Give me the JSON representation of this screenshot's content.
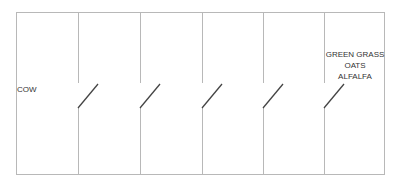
{
  "diagram": {
    "title": "",
    "left_label": "COW",
    "right_labels": [
      "GREEN GRASS",
      "OATS",
      "ALFALFA"
    ],
    "switch_count": 5,
    "switches": [
      {
        "index": 1,
        "state": "open"
      },
      {
        "index": 2,
        "state": "open"
      },
      {
        "index": 3,
        "state": "open"
      },
      {
        "index": 4,
        "state": "open"
      },
      {
        "index": 5,
        "state": "open"
      }
    ],
    "colors": {
      "frame_line": "#b8b8b8",
      "switch_line": "#444444",
      "text": "#333333",
      "background": "#ffffff"
    }
  }
}
